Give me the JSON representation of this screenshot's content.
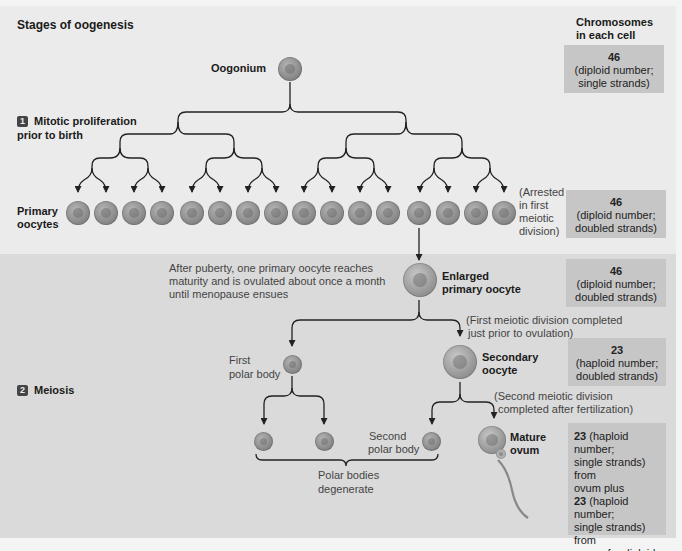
{
  "figure": {
    "title": "Stages of oogenesis",
    "column_header": "Chromosomes\nin each cell",
    "column_header_line1": "Chromosomes",
    "column_header_line2": "in each cell"
  },
  "stages": {
    "stage1": {
      "number": "1",
      "line1": "Mitotic proliferation",
      "line2": "prior to birth"
    },
    "stage2": {
      "number": "2",
      "label": "Meiosis"
    }
  },
  "cells": {
    "oogonium": "Oogonium",
    "primary_oocytes_line1": "Primary",
    "primary_oocytes_line2": "oocytes",
    "primary_oocyte_count": 16,
    "enlarged_line1": "Enlarged",
    "enlarged_line2": "primary oocyte",
    "first_polar_line1": "First",
    "first_polar_line2": "polar body",
    "secondary_line1": "Secondary",
    "secondary_line2": "oocyte",
    "second_polar_line1": "Second",
    "second_polar_line2": "polar body",
    "mature_line1": "Mature",
    "mature_line2": "ovum"
  },
  "notes": {
    "arrested_1": "(Arrested",
    "arrested_2": "in first",
    "arrested_3": "meiotic",
    "arrested_4": "division)",
    "puberty_1": "After puberty, one primary oocyte reaches",
    "puberty_2": "maturity and is ovulated about once a month",
    "puberty_3": "until menopause ensues",
    "first_meiotic_1": "(First meiotic division completed",
    "first_meiotic_2": "just prior to ovulation)",
    "second_meiotic_1": "(Second meiotic division",
    "second_meiotic_2": "completed after fertilization)",
    "polar_degenerate_1": "Polar bodies",
    "polar_degenerate_2": "degenerate"
  },
  "chromosome_boxes": [
    {
      "count": "46",
      "line1": "(diploid number;",
      "line2": "single strands)"
    },
    {
      "count": "46",
      "line1": "(diploid number;",
      "line2": "doubled strands)"
    },
    {
      "count": "46",
      "line1": "(diploid number;",
      "line2": "doubled strands)"
    },
    {
      "count": "23",
      "line1": "(haploid number;",
      "line2": "doubled strands)"
    }
  ],
  "final_box": {
    "n1": "23",
    "t1a": " (haploid number;",
    "t1b": "single strands) from",
    "t1c": "ovum plus",
    "n2": "23",
    "t2a": " (haploid number;",
    "t2b": "single strands) from",
    "t2c": "sperm for diploid",
    "t2d": "fertilized ovum with",
    "n3": "46",
    "t3": " chromosomes"
  },
  "colors": {
    "top_panel": "#ebebeb",
    "bottom_panel": "#dadada",
    "box": "#c6c6c6",
    "line": "#222222",
    "cell": "#8e8e8e"
  }
}
